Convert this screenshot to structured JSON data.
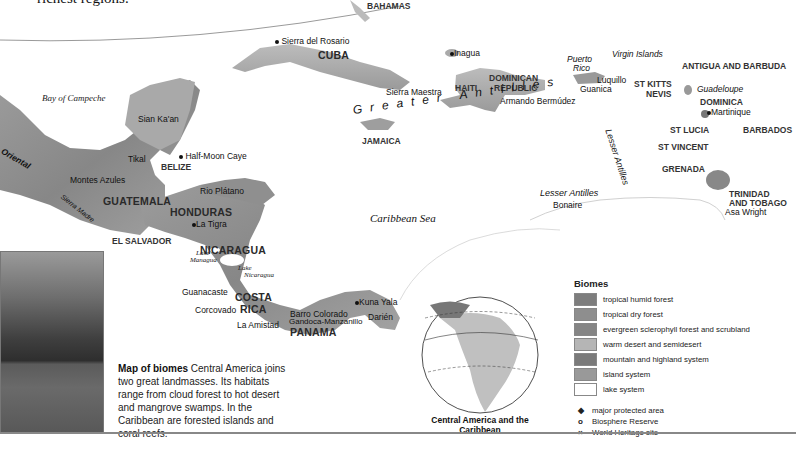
{
  "intro_fragment": "richest regions.",
  "map": {
    "countries": {
      "bahamas": "BAHAMAS",
      "cuba": "CUBA",
      "jamaica": "JAMAICA",
      "haiti": "HAITI",
      "dominican_republic_1": "DOMINICAN",
      "dominican_republic_2": "REPUBLIC",
      "belize": "BELIZE",
      "guatemala": "GUATEMALA",
      "honduras": "HONDURAS",
      "el_salvador": "EL SALVADOR",
      "nicaragua": "NICARAGUA",
      "costa_rica_1": "COSTA",
      "costa_rica_2": "RICA",
      "panama": "PANAMA",
      "st_kitts_1": "ST KITTS",
      "st_kitts_2": "NEVIS",
      "antigua": "ANTIGUA AND BARBUDA",
      "dominica": "DOMINICA",
      "st_lucia": "ST LUCIA",
      "barbados": "BARBADOS",
      "st_vincent": "ST VINCENT",
      "grenada": "GRENADA",
      "trinidad_1": "TRINIDAD",
      "trinidad_2": "AND TOBAGO"
    },
    "regions": {
      "puerto_rico_1": "Puerto",
      "puerto_rico_2": "Rico",
      "virgin_islands": "Virgin Islands",
      "guadeloupe": "Guadeloupe",
      "lesser_antilles_south": "Lesser Antilles",
      "lesser_antilles_arc": "Lesser Antilles",
      "greater_antilles": "Greater Antilles",
      "sierra_madre": "Sierra Madre",
      "oriental": "Oriental"
    },
    "water": {
      "bay_of_campeche": "Bay of Campeche",
      "caribbean_sea": "Caribbean Sea",
      "lake_managua_1": "Lake",
      "lake_managua_2": "Managua",
      "lake_nicaragua_1": "Lake",
      "lake_nicaragua_2": "Nicaragua"
    },
    "sites": {
      "sierra_del_rosario": "Sierra del Rosario",
      "inagua": "Inagua",
      "sierra_maestra": "Sierra Maestra",
      "armando_bermudez": "Armando Bermúdez",
      "luquillo": "Luquillo",
      "guanica": "Guanica",
      "martinique": "Martinique",
      "sian_kaan": "Sian Ka'an",
      "half_moon_caye": "Half-Moon Caye",
      "tikal": "Tikal",
      "montes_azules": "Montes Azules",
      "rio_platano": "Rio Plátano",
      "la_tigra": "La Tigra",
      "guanacaste": "Guanacaste",
      "corcovado": "Corcovado",
      "barro_colorado": "Barro Colorado",
      "la_amistad": "La Amistad",
      "gandoca": "Gandoca-Manzanillo",
      "kuna_yala": "Kuna Yala",
      "darien": "Darién",
      "bonaire": "Bonaire",
      "asa_wright": "Asa Wright"
    }
  },
  "caption": {
    "title": "Map of biomes",
    "body": " Central America joins two great landmasses. Its habitats range from cloud forest to hot desert and mangrove swamps. In the Caribbean are forested islands and coral reefs."
  },
  "globe": {
    "title": "Central America and the Caribbean"
  },
  "legend": {
    "title": "Biomes",
    "biomes": [
      {
        "label": "tropical humid forest",
        "color": "#7d7d7d"
      },
      {
        "label": "tropical dry forest",
        "color": "#8e8e8e"
      },
      {
        "label": "evergreen sclerophyll forest and scrubland",
        "color": "#858585"
      },
      {
        "label": "warm desert and semidesert",
        "color": "#b5b5b5"
      },
      {
        "label": "mountain and highland system",
        "color": "#7a7a7a"
      },
      {
        "label": "island system",
        "color": "#999999"
      },
      {
        "label": "lake system",
        "color": "#ffffff"
      }
    ],
    "symbols": [
      {
        "glyph": "◆",
        "label": "major protected area"
      },
      {
        "glyph": "o",
        "label": "Biosphere Reserve"
      },
      {
        "glyph": "×",
        "label": "World Heritage site"
      }
    ]
  }
}
